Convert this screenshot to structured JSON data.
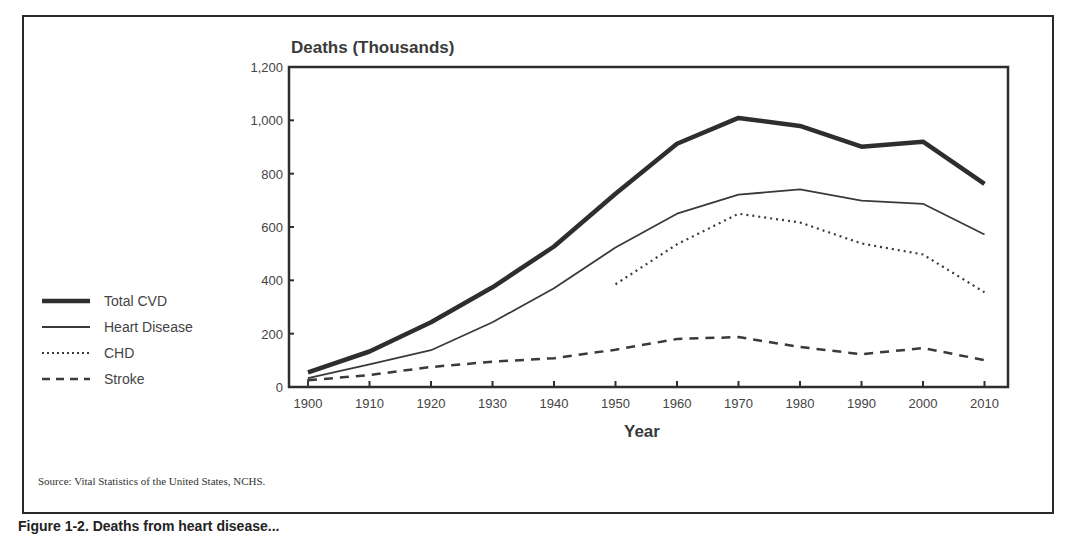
{
  "figure": {
    "y_axis_title": "Deaths (Thousands)",
    "x_axis_title": "Year",
    "source": "Source:  Vital Statistics of the United States, NCHS.",
    "caption_partial": "Figure 1-2. Deaths from heart disease..."
  },
  "legend": {
    "items": [
      {
        "label": "Total CVD",
        "style": "thick-solid"
      },
      {
        "label": "Heart Disease",
        "style": "thin-solid"
      },
      {
        "label": "CHD",
        "style": "dotted"
      },
      {
        "label": "Stroke",
        "style": "dashed"
      }
    ]
  },
  "chart_data": {
    "type": "line",
    "title": "",
    "xlabel": "Year",
    "ylabel": "Deaths (Thousands)",
    "x": [
      1900,
      1910,
      1920,
      1930,
      1940,
      1950,
      1960,
      1970,
      1980,
      1990,
      2000,
      2010
    ],
    "x_ticks": [
      "1900",
      "1910",
      "1920",
      "1930",
      "1940",
      "1950",
      "1960",
      "1970",
      "1980",
      "1990",
      "2000",
      "2010"
    ],
    "y_ticks": [
      "0",
      "200",
      "400",
      "600",
      "800",
      "1,000",
      "1,200"
    ],
    "ylim": [
      0,
      1200
    ],
    "grid": false,
    "legend_position": "left",
    "series": [
      {
        "name": "Total CVD",
        "values": [
          55,
          133,
          243,
          374,
          527,
          725,
          912,
          1009,
          979,
          901,
          920,
          762
        ]
      },
      {
        "name": "Heart Disease",
        "values": [
          33,
          85,
          138,
          243,
          370,
          523,
          650,
          721,
          741,
          699,
          687,
          572
        ]
      },
      {
        "name": "CHD",
        "values": [
          null,
          null,
          null,
          null,
          null,
          385,
          535,
          650,
          617,
          538,
          497,
          355
        ]
      },
      {
        "name": "Stroke",
        "values": [
          25,
          45,
          75,
          95,
          108,
          140,
          180,
          187,
          150,
          123,
          146,
          101
        ]
      }
    ]
  }
}
